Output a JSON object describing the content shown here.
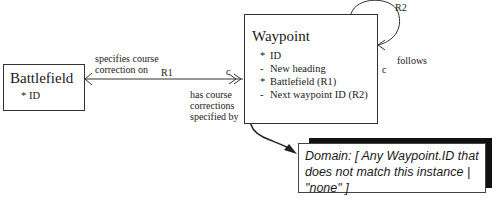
{
  "entities": {
    "battlefield": {
      "name": "Battlefield",
      "attributes": [
        {
          "marker": "*",
          "text": "ID"
        }
      ]
    },
    "waypoint": {
      "name": "Waypoint",
      "attributes": [
        {
          "marker": "*",
          "text": "ID"
        },
        {
          "marker": "-",
          "text": "New heading"
        },
        {
          "marker": "*",
          "text": "Battlefield (R1)"
        },
        {
          "marker": "-",
          "text": "Next waypoint ID (R2)"
        }
      ]
    }
  },
  "relationships": {
    "r1": {
      "label": "R1",
      "from_phrase": "specifies course correction on",
      "from_phrase_line1": "specifies course",
      "from_phrase_line2": "correction on",
      "to_phrase_line1": "has course",
      "to_phrase_line2": "corrections",
      "to_phrase_line3": "specified by",
      "conditionality": "c"
    },
    "r2": {
      "label": "R2",
      "phrase": "follows",
      "conditionality": "c"
    }
  },
  "note": {
    "line1": "Domain: [ Any Waypoint.ID that",
    "line2": "does not match this instance |",
    "line3": "\"none\" ]"
  }
}
